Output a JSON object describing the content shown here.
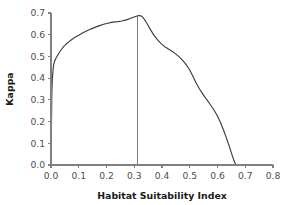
{
  "chart_data": {
    "type": "line",
    "title": "",
    "xlabel": "Habitat Suitability Index",
    "ylabel": "Kappa",
    "xlim": [
      0.0,
      0.8
    ],
    "ylim": [
      0.0,
      0.7
    ],
    "xticks": [
      0.0,
      0.1,
      0.2,
      0.3,
      0.4,
      0.5,
      0.6,
      0.7,
      0.8
    ],
    "xtick_labels": [
      "0.0",
      "0.1",
      "0.2",
      "0.3",
      "0.4",
      "0.5",
      "0.6",
      "0.7",
      "0.8"
    ],
    "yticks": [
      0.0,
      0.1,
      0.2,
      0.3,
      0.4,
      0.5,
      0.6,
      0.7
    ],
    "ytick_labels": [
      "0.0",
      "0.1",
      "0.2",
      "0.3",
      "0.4",
      "0.5",
      "0.6",
      "0.7"
    ],
    "grid": false,
    "legend": false,
    "line_color": "#3c3c3c",
    "axis_color": "#808080",
    "series": [
      {
        "name": "Kappa vs Habitat Suitability Index",
        "x": [
          0.0,
          0.003,
          0.005,
          0.008,
          0.01,
          0.013,
          0.016,
          0.02,
          0.025,
          0.03,
          0.038,
          0.046,
          0.055,
          0.065,
          0.075,
          0.088,
          0.1,
          0.115,
          0.13,
          0.145,
          0.16,
          0.175,
          0.19,
          0.205,
          0.218,
          0.23,
          0.242,
          0.255,
          0.268,
          0.28,
          0.292,
          0.302,
          0.31,
          0.316,
          0.32,
          0.325,
          0.33,
          0.336,
          0.342,
          0.35,
          0.36,
          0.372,
          0.385,
          0.398,
          0.41,
          0.422,
          0.435,
          0.448,
          0.46,
          0.472,
          0.485,
          0.498,
          0.51,
          0.522,
          0.535,
          0.548,
          0.56,
          0.572,
          0.585,
          0.598,
          0.61,
          0.622,
          0.632,
          0.642,
          0.652,
          0.66,
          0.665,
          0.672,
          0.7,
          0.75,
          0.8
        ],
        "y": [
          0.0,
          0.33,
          0.4,
          0.445,
          0.465,
          0.478,
          0.487,
          0.496,
          0.508,
          0.518,
          0.533,
          0.546,
          0.557,
          0.568,
          0.578,
          0.589,
          0.598,
          0.609,
          0.618,
          0.627,
          0.635,
          0.642,
          0.648,
          0.653,
          0.657,
          0.659,
          0.66,
          0.663,
          0.667,
          0.672,
          0.678,
          0.683,
          0.686,
          0.688,
          0.688,
          0.686,
          0.681,
          0.672,
          0.66,
          0.642,
          0.62,
          0.596,
          0.575,
          0.558,
          0.545,
          0.535,
          0.525,
          0.513,
          0.5,
          0.485,
          0.466,
          0.442,
          0.412,
          0.38,
          0.35,
          0.325,
          0.303,
          0.282,
          0.258,
          0.23,
          0.198,
          0.16,
          0.125,
          0.088,
          0.048,
          0.018,
          0.004,
          0.0,
          0.0,
          0.0,
          0.0
        ]
      }
    ],
    "reference_line": {
      "orientation": "vertical",
      "x": 0.31,
      "y_top": 0.688,
      "y_bottom": 0.0
    }
  }
}
